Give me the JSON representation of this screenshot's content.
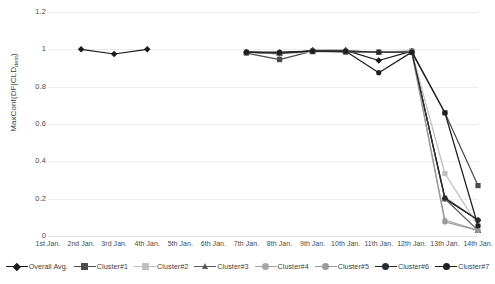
{
  "chart_data": {
    "type": "line",
    "title": "",
    "xlabel": "",
    "ylabel": "MaxConf(DF|CLD_dest)",
    "ylabel_main": "MaxConf(DF|CLD",
    "ylabel_sub": "dest",
    "ylabel_tail": ")",
    "ylim": [
      0,
      1.2
    ],
    "yticks": [
      0,
      0.2,
      0.4,
      0.6,
      0.8,
      1,
      1.2
    ],
    "ytick_labels": [
      "0",
      "0.2",
      "0.4",
      "0.6",
      "0.8",
      "1",
      "1.2"
    ],
    "grid": true,
    "legend_position": "bottom",
    "categories": [
      "1st Jan.",
      "2nd Jan.",
      "3rd Jan.",
      "4th Jan.",
      "5th Jan.",
      "6th Jan.",
      "7th Jan.",
      "8th Jan.",
      "9th Jan.",
      "10th Jan.",
      "11th Jan.",
      "12th Jan.",
      "13th Jan.",
      "14th Jan."
    ],
    "series": [
      {
        "name": "Overall Avg.",
        "color": "#1a1a1a",
        "marker": "diamond",
        "values": [
          null,
          1.0,
          0.975,
          1.0,
          null,
          null,
          0.985,
          0.975,
          0.995,
          0.995,
          0.94,
          0.99,
          0.2,
          0.085
        ]
      },
      {
        "name": "Cluster#1",
        "color": "#4c4c4c",
        "marker": "square",
        "values": [
          null,
          null,
          null,
          null,
          null,
          null,
          0.98,
          0.945,
          0.99,
          0.985,
          0.985,
          0.99,
          0.66,
          0.27
        ]
      },
      {
        "name": "Cluster#2",
        "color": "#bfbfbf",
        "marker": "square",
        "values": [
          null,
          null,
          null,
          null,
          null,
          null,
          0.985,
          0.975,
          0.985,
          0.99,
          0.985,
          0.985,
          0.335,
          0.055
        ]
      },
      {
        "name": "Cluster#3",
        "color": "#5a5a5a",
        "marker": "triangle",
        "values": [
          null,
          null,
          null,
          null,
          null,
          null,
          0.985,
          0.98,
          0.99,
          0.99,
          0.985,
          0.985,
          0.2,
          0.03
        ]
      },
      {
        "name": "Cluster#4",
        "color": "#a6a6a6",
        "marker": "circle",
        "values": [
          null,
          null,
          null,
          null,
          null,
          null,
          0.985,
          0.98,
          0.99,
          0.99,
          0.985,
          0.985,
          0.085,
          0.03
        ]
      },
      {
        "name": "Cluster#5",
        "color": "#9a9a9a",
        "marker": "circle",
        "values": [
          null,
          null,
          null,
          null,
          null,
          null,
          0.985,
          0.98,
          0.99,
          0.99,
          0.985,
          0.985,
          0.075,
          0.03
        ]
      },
      {
        "name": "Cluster#6",
        "color": "#2b2b2b",
        "marker": "circle",
        "values": [
          null,
          null,
          null,
          null,
          null,
          null,
          0.985,
          0.98,
          0.99,
          0.99,
          0.985,
          0.985,
          0.205,
          0.085
        ]
      },
      {
        "name": "Cluster#7",
        "color": "#1f1f1f",
        "marker": "circle",
        "values": [
          null,
          null,
          null,
          null,
          null,
          null,
          0.985,
          0.985,
          0.99,
          0.99,
          0.875,
          0.985,
          0.66,
          0.055
        ]
      }
    ]
  }
}
